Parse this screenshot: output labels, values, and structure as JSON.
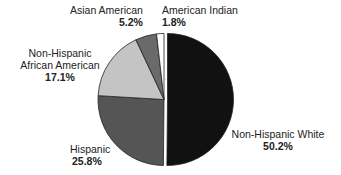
{
  "chart_data": {
    "type": "pie",
    "title": "",
    "slices": [
      {
        "label": "Non-Hispanic White",
        "value": 50.2,
        "value_label": "50.2%",
        "color": "#111111",
        "exploded": true
      },
      {
        "label": "Hispanic",
        "value": 25.8,
        "value_label": "25.8%",
        "color": "#555555",
        "exploded": false
      },
      {
        "label": "Non-Hispanic African American",
        "value": 17.1,
        "value_label": "17.1%",
        "color": "#c4c4c4",
        "exploded": false
      },
      {
        "label": "Asian American",
        "value": 5.2,
        "value_label": "5.2%",
        "color": "#6a6a6a",
        "exploded": false
      },
      {
        "label": "American Indian",
        "value": 1.8,
        "value_label": "1.8%",
        "color": "#ffffff",
        "exploded": false
      }
    ],
    "legend": "none",
    "labels_position": "outside"
  },
  "labels": {
    "white": {
      "name": "Non-Hispanic White",
      "pct": "50.2%"
    },
    "hispanic": {
      "name": "Hispanic",
      "pct": "25.8%"
    },
    "african": {
      "line1": "Non-Hispanic",
      "line2": "African American",
      "pct": "17.1%"
    },
    "asian": {
      "name": "Asian American",
      "pct": "5.2%"
    },
    "indian": {
      "name": "American Indian",
      "pct": "1.8%"
    }
  }
}
